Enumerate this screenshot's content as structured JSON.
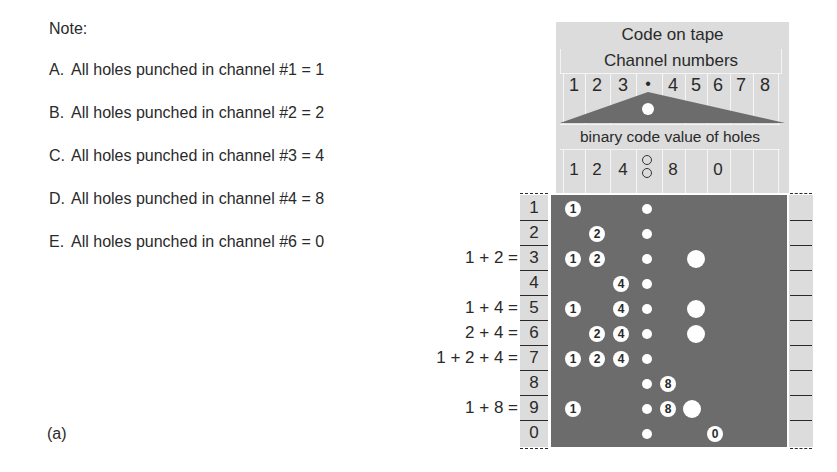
{
  "notes": {
    "title": "Note:",
    "items": [
      {
        "letter": "A.",
        "text": "All holes punched in channel #1 = 1"
      },
      {
        "letter": "B.",
        "text": "All holes punched in channel #2 = 2"
      },
      {
        "letter": "C.",
        "text": "All holes punched in channel #3 = 4"
      },
      {
        "letter": "D.",
        "text": "All holes punched in channel #4 = 8"
      },
      {
        "letter": "E.",
        "text": "All holes punched in channel #6 = 0"
      }
    ]
  },
  "figure_label": "(a)",
  "header": {
    "title": "Code on tape",
    "channels_label": "Channel numbers",
    "channel_numbers": [
      "1",
      "2",
      "3",
      "•",
      "4",
      "5",
      "6",
      "7",
      "8"
    ],
    "binary_label": "binary code value of holes",
    "binary_values": [
      "1",
      "2",
      "4",
      "",
      "8",
      "",
      "0",
      "",
      ""
    ]
  },
  "rows": [
    {
      "digit": "1",
      "equation": "",
      "holes": [
        "1"
      ],
      "big": false
    },
    {
      "digit": "2",
      "equation": "",
      "holes": [
        "2"
      ],
      "big": false
    },
    {
      "digit": "3",
      "equation": "1 + 2 =",
      "holes": [
        "1",
        "2"
      ],
      "big": true
    },
    {
      "digit": "4",
      "equation": "",
      "holes": [
        "4"
      ],
      "big": false
    },
    {
      "digit": "5",
      "equation": "1 + 4 =",
      "holes": [
        "1",
        "4"
      ],
      "big": true
    },
    {
      "digit": "6",
      "equation": "2 + 4 =",
      "holes": [
        "2",
        "4"
      ],
      "big": true
    },
    {
      "digit": "7",
      "equation": "1 + 2 + 4 =",
      "holes": [
        "1",
        "2",
        "4"
      ],
      "big": false
    },
    {
      "digit": "8",
      "equation": "",
      "holes": [
        "8"
      ],
      "big": false
    },
    {
      "digit": "9",
      "equation": "1 + 8 =",
      "holes": [
        "1",
        "8"
      ],
      "big": true
    },
    {
      "digit": "0",
      "equation": "",
      "holes": [
        "0"
      ],
      "big": false
    }
  ],
  "colors": {
    "tape": "#6c6c6c",
    "header_fill": "#dcdcdc",
    "hole": "#ffffff",
    "text": "#2a2a2a"
  }
}
